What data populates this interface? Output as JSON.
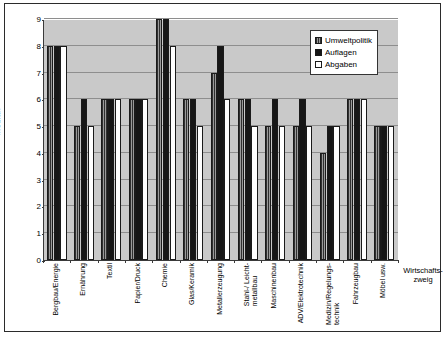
{
  "chart_data": {
    "type": "bar",
    "title": "",
    "xlabel": "Wirtschafts-\nzweig",
    "ylabel": "Median",
    "ylim": [
      0,
      9
    ],
    "yticks": [
      0,
      1,
      2,
      3,
      4,
      5,
      6,
      7,
      8,
      9
    ],
    "grid": true,
    "legend_position": "top-right",
    "plot_background": "#c9c9c9",
    "categories": [
      "Bergbau/Energie",
      "Ernährung",
      "Textil",
      "Papier/Druck",
      "Chemie",
      "Glas/Keramik",
      "Metallerzeugung",
      "Stahl-/ Leicht-\nmetallbau",
      "Maschinenbau",
      "ADV/Elektrotechnik",
      "Medizin/Regelungs-\ntechnik",
      "Fahrzeugbau",
      "Möbel usw."
    ],
    "series": [
      {
        "name": "Umweltpolitik",
        "fill": "hatched-gray",
        "color": "#4a4a4a",
        "values": [
          8,
          5,
          6,
          6,
          9,
          6,
          7,
          6,
          5,
          5,
          4,
          6,
          5
        ]
      },
      {
        "name": "Auflagen",
        "fill": "solid-black",
        "color": "#161616",
        "values": [
          8,
          6,
          6,
          6,
          9,
          6,
          8,
          6,
          6,
          6,
          5,
          6,
          5
        ]
      },
      {
        "name": "Abgaben",
        "fill": "white",
        "color": "#ffffff",
        "values": [
          8,
          5,
          6,
          6,
          8,
          5,
          6,
          5,
          5,
          5,
          5,
          6,
          5
        ]
      }
    ]
  }
}
